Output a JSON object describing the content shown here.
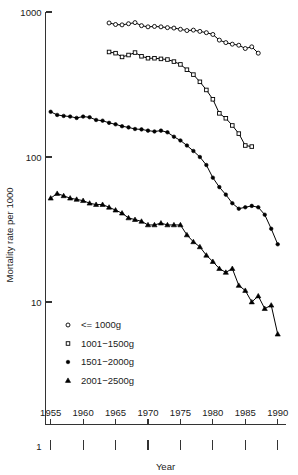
{
  "chart_data": {
    "type": "line",
    "title": "",
    "xlabel": "Year",
    "ylabel": "Mortality rate per 1000",
    "xlim": [
      1954,
      1991
    ],
    "ylim": [
      1,
      1000
    ],
    "yscale": "log",
    "grid": false,
    "legend_position": "lower-left",
    "x_tick_labels": [
      "1955",
      "1960",
      "1965",
      "1970",
      "1975",
      "1980",
      "1985",
      "1990"
    ],
    "x_ticks": [
      1955,
      1960,
      1965,
      1970,
      1975,
      1980,
      1985,
      1990
    ],
    "y_tick_labels": [
      "1000",
      "100",
      "10",
      "1"
    ],
    "y_ticks": [
      1000,
      100,
      10,
      1
    ],
    "series": [
      {
        "name": "<= 1000g",
        "marker": "open-circle",
        "x": [
          1964,
          1965,
          1966,
          1967,
          1968,
          1969,
          1970,
          1971,
          1972,
          1973,
          1974,
          1975,
          1976,
          1977,
          1978,
          1979,
          1980,
          1981,
          1982,
          1983,
          1984,
          1985,
          1986,
          1987
        ],
        "values": [
          840,
          820,
          815,
          830,
          845,
          805,
          790,
          795,
          790,
          780,
          775,
          760,
          745,
          750,
          735,
          720,
          700,
          640,
          615,
          600,
          590,
          560,
          575,
          520
        ]
      },
      {
        "name": "1001-1500g",
        "marker": "open-square",
        "x": [
          1964,
          1965,
          1966,
          1967,
          1968,
          1969,
          1970,
          1971,
          1972,
          1973,
          1974,
          1975,
          1976,
          1977,
          1978,
          1979,
          1980,
          1981,
          1982,
          1983,
          1984,
          1985,
          1986
        ],
        "values": [
          530,
          520,
          490,
          505,
          525,
          495,
          480,
          480,
          475,
          470,
          455,
          435,
          400,
          370,
          330,
          290,
          250,
          200,
          185,
          165,
          145,
          120,
          118
        ]
      },
      {
        "name": "1501-2000g",
        "marker": "filled-circle",
        "x": [
          1955,
          1956,
          1957,
          1958,
          1959,
          1960,
          1961,
          1962,
          1963,
          1964,
          1965,
          1966,
          1967,
          1968,
          1969,
          1970,
          1971,
          1972,
          1973,
          1974,
          1975,
          1976,
          1977,
          1978,
          1979,
          1980,
          1981,
          1982,
          1983,
          1984,
          1985,
          1986,
          1987,
          1988,
          1989,
          1990
        ],
        "values": [
          205,
          195,
          192,
          190,
          186,
          190,
          188,
          180,
          178,
          172,
          168,
          163,
          160,
          156,
          155,
          152,
          150,
          152,
          148,
          138,
          130,
          120,
          110,
          100,
          88,
          72,
          62,
          55,
          48,
          44,
          45,
          46,
          45,
          40,
          32,
          25
        ]
      },
      {
        "name": "2001-2500g",
        "marker": "filled-triangle",
        "x": [
          1955,
          1956,
          1957,
          1958,
          1959,
          1960,
          1961,
          1962,
          1963,
          1964,
          1965,
          1966,
          1967,
          1968,
          1969,
          1970,
          1971,
          1972,
          1973,
          1974,
          1975,
          1976,
          1977,
          1978,
          1979,
          1980,
          1981,
          1982,
          1983,
          1984,
          1985,
          1986,
          1987,
          1988,
          1989,
          1990
        ],
        "values": [
          52,
          56,
          54,
          52,
          51,
          50,
          48,
          47,
          47,
          45,
          43,
          41,
          38,
          37,
          36,
          34,
          34,
          35,
          34,
          34,
          34,
          29,
          26,
          24,
          21,
          19,
          17,
          16,
          17,
          13,
          12,
          10,
          11,
          9,
          9.5,
          6
        ]
      }
    ]
  },
  "legend": {
    "items": [
      {
        "label": "<= 1000g",
        "marker": "open-circle"
      },
      {
        "label": "1001−1500g",
        "marker": "open-square"
      },
      {
        "label": "1501−2000g",
        "marker": "filled-circle"
      },
      {
        "label": "2001−2500g",
        "marker": "filled-triangle"
      }
    ]
  },
  "axes": {
    "y_title": "Mortality rate per 1000",
    "x_title": "Year",
    "y_labels": [
      "1000",
      "100",
      "10",
      "1"
    ],
    "x_labels": [
      "1955",
      "1960",
      "1965",
      "1970",
      "1975",
      "1980",
      "1985",
      "1990"
    ]
  },
  "colors": {
    "ink": "#000000",
    "axis": "#333333",
    "background": "#ffffff"
  }
}
